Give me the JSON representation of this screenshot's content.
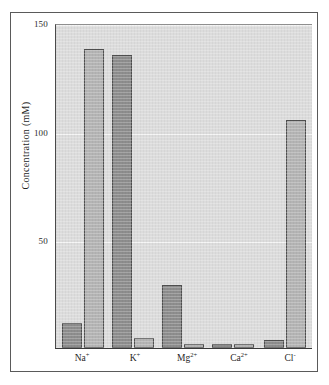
{
  "chart_data": {
    "type": "bar",
    "title": "",
    "xlabel": "",
    "ylabel": "Concentration (mM)",
    "ylim": [
      0,
      155
    ],
    "yticks": [
      50,
      100,
      150
    ],
    "ytick_labels": [
      "50",
      "100",
      "150"
    ],
    "grid": "horizontal",
    "legend": "none",
    "categories": [
      "Na+",
      "K+",
      "Mg2+",
      "Ca2+",
      "Cl-"
    ],
    "category_labels_html": [
      "Na<sup>+</sup>",
      "K<sup>+</sup>",
      "Mg<sup>2+</sup>",
      "Ca<sup>2+</sup>",
      "Cl<sup>-</sup>"
    ],
    "series": [
      {
        "name": "series-dark",
        "color": "#8d8d8d",
        "values": [
          12,
          140,
          30,
          1,
          4
        ]
      },
      {
        "name": "series-light",
        "color": "#b4b4b4",
        "values": [
          143,
          5,
          2,
          2,
          109
        ]
      }
    ]
  },
  "axis": {
    "y_title": "Concentration (mM)",
    "y_tick_150": "150",
    "y_tick_100": "100",
    "y_tick_50": "50"
  },
  "xlabels": {
    "na": "Na",
    "na_sup": "+",
    "k": "K",
    "k_sup": "+",
    "mg": "Mg",
    "mg_sup": "2+",
    "ca": "Ca",
    "ca_sup": "2+",
    "cl": "Cl",
    "cl_sup": "-"
  },
  "colors": {
    "plot_background": "#dcdcdc",
    "bar_dark": "#8d8d8d",
    "bar_light": "#b4b4b4",
    "bar_edge": "#4f4f4f",
    "gridline": "#f4f4f4",
    "axis": "#3a3a3a",
    "frame": "#5a5a5a",
    "text": "#1f1f1f"
  }
}
